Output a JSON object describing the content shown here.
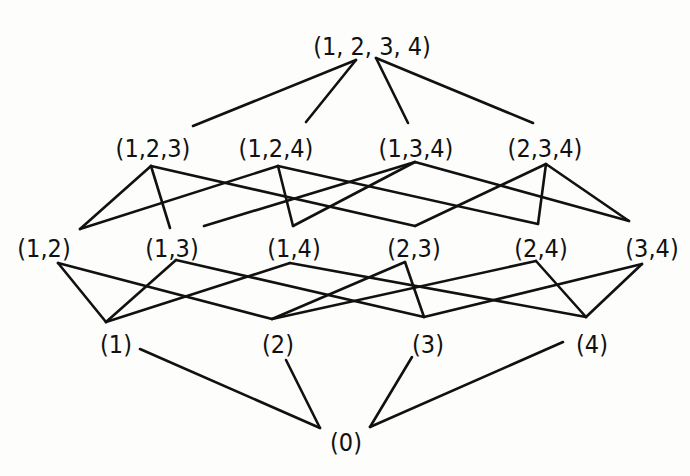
{
  "diagram": {
    "type": "hasse-diagram",
    "colors": {
      "ink": "#111111",
      "background": "#fdfdfb"
    },
    "nodes": [
      {
        "id": "1234",
        "label": "(1, 2, 3, 4)",
        "x": 372,
        "y": 48
      },
      {
        "id": "123",
        "label": "(1,2,3)",
        "x": 153,
        "y": 150
      },
      {
        "id": "124",
        "label": "(1,2,4)",
        "x": 276,
        "y": 150
      },
      {
        "id": "134",
        "label": "(1,3,4)",
        "x": 416,
        "y": 150
      },
      {
        "id": "234",
        "label": "(2,3,4)",
        "x": 545,
        "y": 150
      },
      {
        "id": "12",
        "label": "(1,2)",
        "x": 44,
        "y": 250
      },
      {
        "id": "13",
        "label": "(1,3)",
        "x": 172,
        "y": 250
      },
      {
        "id": "14",
        "label": "(1,4)",
        "x": 294,
        "y": 250
      },
      {
        "id": "23",
        "label": "(2,3)",
        "x": 414,
        "y": 250
      },
      {
        "id": "24",
        "label": "(2,4)",
        "x": 541,
        "y": 250
      },
      {
        "id": "34",
        "label": "(3,4)",
        "x": 652,
        "y": 250
      },
      {
        "id": "1",
        "label": "(1)",
        "x": 116,
        "y": 346
      },
      {
        "id": "2",
        "label": "(2)",
        "x": 278,
        "y": 346
      },
      {
        "id": "3",
        "label": "(3)",
        "x": 428,
        "y": 346
      },
      {
        "id": "4",
        "label": "(4)",
        "x": 592,
        "y": 346
      },
      {
        "id": "0",
        "label": "(0)",
        "x": 346,
        "y": 444
      }
    ],
    "edges": [
      {
        "from": "1234",
        "to": "123",
        "x1": 356,
        "y1": 60,
        "x2": 193,
        "y2": 126
      },
      {
        "from": "1234",
        "to": "124",
        "x1": 356,
        "y1": 60,
        "x2": 306,
        "y2": 122
      },
      {
        "from": "1234",
        "to": "134",
        "x1": 376,
        "y1": 58,
        "x2": 408,
        "y2": 123
      },
      {
        "from": "1234",
        "to": "234",
        "x1": 376,
        "y1": 58,
        "x2": 533,
        "y2": 123
      },
      {
        "from": "123",
        "to": "12",
        "x1": 151,
        "y1": 166,
        "x2": 80,
        "y2": 229
      },
      {
        "from": "123",
        "to": "13",
        "x1": 151,
        "y1": 166,
        "x2": 170,
        "y2": 228
      },
      {
        "from": "123",
        "to": "23",
        "x1": 151,
        "y1": 166,
        "x2": 415,
        "y2": 226
      },
      {
        "from": "124",
        "to": "12",
        "x1": 278,
        "y1": 166,
        "x2": 80,
        "y2": 229
      },
      {
        "from": "124",
        "to": "14",
        "x1": 278,
        "y1": 166,
        "x2": 293,
        "y2": 226
      },
      {
        "from": "124",
        "to": "24",
        "x1": 278,
        "y1": 166,
        "x2": 538,
        "y2": 224
      },
      {
        "from": "134",
        "to": "13",
        "x1": 415,
        "y1": 162,
        "x2": 204,
        "y2": 226
      },
      {
        "from": "134",
        "to": "14",
        "x1": 415,
        "y1": 162,
        "x2": 293,
        "y2": 226
      },
      {
        "from": "134",
        "to": "34",
        "x1": 415,
        "y1": 162,
        "x2": 629,
        "y2": 221
      },
      {
        "from": "234",
        "to": "23",
        "x1": 546,
        "y1": 164,
        "x2": 415,
        "y2": 226
      },
      {
        "from": "234",
        "to": "24",
        "x1": 546,
        "y1": 164,
        "x2": 538,
        "y2": 224
      },
      {
        "from": "234",
        "to": "34",
        "x1": 546,
        "y1": 164,
        "x2": 629,
        "y2": 221
      },
      {
        "from": "12",
        "to": "1",
        "x1": 58,
        "y1": 263,
        "x2": 106,
        "y2": 322
      },
      {
        "from": "12",
        "to": "2",
        "x1": 58,
        "y1": 263,
        "x2": 272,
        "y2": 319
      },
      {
        "from": "13",
        "to": "1",
        "x1": 176,
        "y1": 260,
        "x2": 106,
        "y2": 322
      },
      {
        "from": "13",
        "to": "3",
        "x1": 176,
        "y1": 260,
        "x2": 424,
        "y2": 317
      },
      {
        "from": "14",
        "to": "1",
        "x1": 290,
        "y1": 263,
        "x2": 106,
        "y2": 322
      },
      {
        "from": "14",
        "to": "4",
        "x1": 290,
        "y1": 263,
        "x2": 586,
        "y2": 317
      },
      {
        "from": "23",
        "to": "2",
        "x1": 405,
        "y1": 262,
        "x2": 272,
        "y2": 319
      },
      {
        "from": "23",
        "to": "3",
        "x1": 405,
        "y1": 262,
        "x2": 424,
        "y2": 317
      },
      {
        "from": "24",
        "to": "2",
        "x1": 536,
        "y1": 261,
        "x2": 272,
        "y2": 319
      },
      {
        "from": "24",
        "to": "4",
        "x1": 536,
        "y1": 261,
        "x2": 586,
        "y2": 317
      },
      {
        "from": "34",
        "to": "3",
        "x1": 642,
        "y1": 264,
        "x2": 424,
        "y2": 317
      },
      {
        "from": "34",
        "to": "4",
        "x1": 642,
        "y1": 264,
        "x2": 586,
        "y2": 317
      },
      {
        "from": "1",
        "to": "0",
        "x1": 140,
        "y1": 349,
        "x2": 320,
        "y2": 428
      },
      {
        "from": "2",
        "to": "0",
        "x1": 286,
        "y1": 360,
        "x2": 320,
        "y2": 428
      },
      {
        "from": "3",
        "to": "0",
        "x1": 412,
        "y1": 357,
        "x2": 370,
        "y2": 427
      },
      {
        "from": "4",
        "to": "0",
        "x1": 563,
        "y1": 342,
        "x2": 370,
        "y2": 427
      }
    ]
  }
}
